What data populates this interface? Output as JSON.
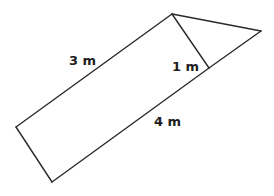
{
  "diagram": {
    "type": "geometry-figure",
    "labels": {
      "side_a": "3 m",
      "side_b": "4 m",
      "height": "1 m"
    },
    "colors": {
      "stroke": "#2a2a2a",
      "text": "#1e1e1e",
      "background": "#ffffff"
    }
  }
}
